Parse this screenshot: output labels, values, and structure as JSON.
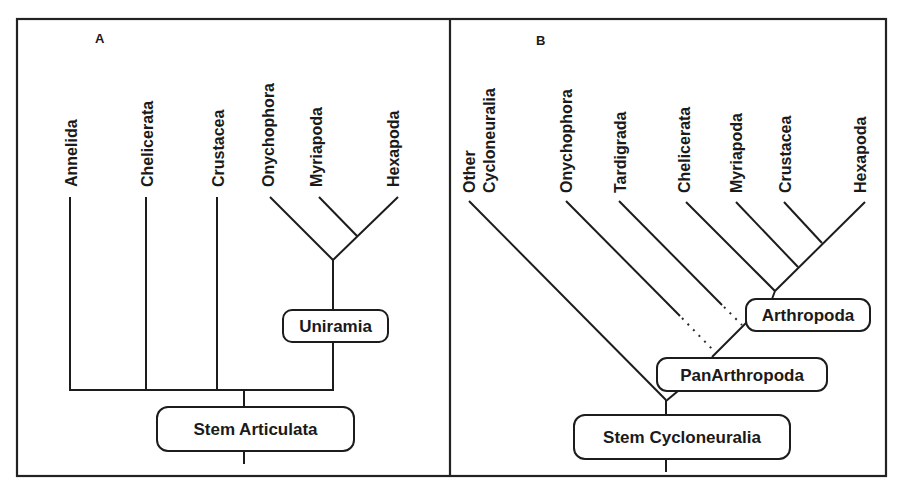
{
  "figure": {
    "colors": {
      "line": "#1c1c1c",
      "background": "#ffffff",
      "text": "#1a1a1a"
    }
  },
  "panel_a": {
    "letter": "A",
    "taxa": [
      {
        "label": "Annelida"
      },
      {
        "label": "Chelicerata"
      },
      {
        "label": "Crustacea"
      },
      {
        "label": "Onychophora"
      },
      {
        "label": "Myriapoda"
      },
      {
        "label": "Hexapoda"
      }
    ],
    "nodes": {
      "uniramia": "Uniramia",
      "stem": "Stem Articulata"
    }
  },
  "panel_b": {
    "letter": "B",
    "taxa": [
      {
        "label_line1": "Other",
        "label_line2": "Cycloneuralia"
      },
      {
        "label": "Onychophora"
      },
      {
        "label": "Tardigrada"
      },
      {
        "label": "Chelicerata"
      },
      {
        "label": "Myriapoda"
      },
      {
        "label": "Crustacea"
      },
      {
        "label": "Hexapoda"
      }
    ],
    "nodes": {
      "arthropoda": "Arthropoda",
      "panarthropoda": "PanArthropoda",
      "stem": "Stem Cycloneuralia"
    }
  }
}
